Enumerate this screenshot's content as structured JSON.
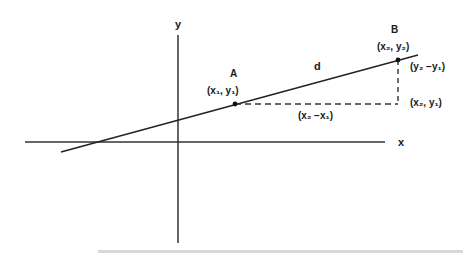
{
  "diagram": {
    "axes": {
      "x_label": "x",
      "y_label": "y"
    },
    "points": {
      "A": {
        "name": "A",
        "coords": "(x₁, y₁)"
      },
      "B": {
        "name": "B",
        "coords": "(x₂, y₂)"
      },
      "C": {
        "coords": "(x₂, y₁)"
      }
    },
    "segment_label": "d",
    "dx_label": "(x₂ −x₁)",
    "dy_label": "(y₂ −y₁)"
  }
}
